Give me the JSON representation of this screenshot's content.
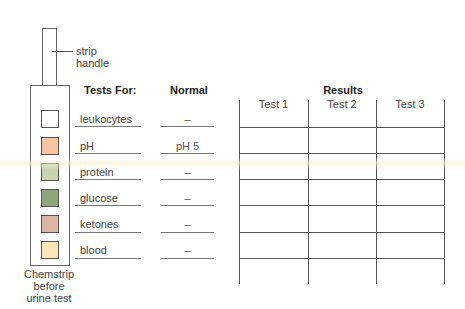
{
  "strip": {
    "handle_label_line1": "strip",
    "handle_label_line2": "handle",
    "caption_line1": "Chemstrip",
    "caption_line2": "before",
    "caption_line3": "urine test"
  },
  "headers": {
    "tests_for": "Tests For:",
    "normal": "Normal",
    "results": "Results",
    "test_columns": [
      "Test 1",
      "Test 2",
      "Test 3"
    ]
  },
  "rows": [
    {
      "test": "leukocytes",
      "normal": "–",
      "pad_color": "#ffffff"
    },
    {
      "test": "pH",
      "normal": "pH 5",
      "pad_color": "#f6c49e"
    },
    {
      "test": "protein",
      "normal": "–",
      "pad_color": "#c9d3b0"
    },
    {
      "test": "glucose",
      "normal": "–",
      "pad_color": "#8fa57a"
    },
    {
      "test": "ketones",
      "normal": "–",
      "pad_color": "#deb3a8"
    },
    {
      "test": "blood",
      "normal": "–",
      "pad_color": "#fbe6b8"
    }
  ],
  "results": [
    [
      "",
      "",
      ""
    ],
    [
      "",
      "",
      ""
    ],
    [
      "",
      "",
      ""
    ],
    [
      "",
      "",
      ""
    ],
    [
      "",
      "",
      ""
    ],
    [
      "",
      "",
      ""
    ]
  ]
}
